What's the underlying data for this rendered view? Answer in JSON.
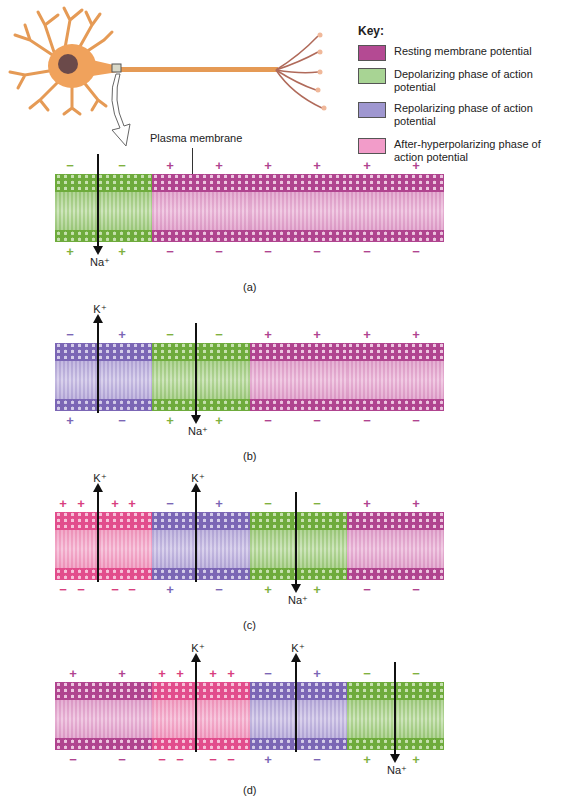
{
  "colors": {
    "resting": {
      "head": "#b0448f",
      "tail": "#ecc4df",
      "mid": "#f8e4f1",
      "charge": "#b0448f"
    },
    "depolarizing": {
      "head": "#6eab3c",
      "tail": "#c5e0ae",
      "mid": "#e6f2dc",
      "charge": "#7fb13f"
    },
    "repolarizing": {
      "head": "#7b66b5",
      "tail": "#d3cbe8",
      "mid": "#ece8f6",
      "charge": "#7b66b5"
    },
    "after_hyperpolarizing": {
      "head": "#e24d8c",
      "tail": "#f6c0d8",
      "mid": "#fbe2ee",
      "charge": "#d8407e"
    }
  },
  "key": {
    "title": "Key:",
    "items": [
      {
        "label": "Resting membrane potential",
        "color": "#b44a93"
      },
      {
        "label": "Depolarizing phase of action potential",
        "color": "#a8d494"
      },
      {
        "label": "Repolarizing phase of action potential",
        "color": "#9f97d0"
      },
      {
        "label": "After-hyperpolarizing phase of action potential",
        "color": "#f29cc9"
      }
    ]
  },
  "neuron": {
    "body_color": "#f0a25c",
    "nucleus_color": "#6b4a4a"
  },
  "callout": {
    "plasma_membrane": "Plasma membrane"
  },
  "ions": {
    "na": "Na⁺",
    "k": "K⁺"
  },
  "panels": [
    {
      "label": "(a)",
      "segments": [
        "depolarizing",
        "resting",
        "resting",
        "resting"
      ],
      "top_charges": [
        "−",
        "−",
        "+",
        "+",
        "+",
        "+",
        "+",
        "+"
      ],
      "bottom_charges": [
        "+",
        "+",
        "−",
        "−",
        "−",
        "−",
        "−",
        "−"
      ]
    },
    {
      "label": "(b)",
      "segments": [
        "repolarizing",
        "depolarizing",
        "resting",
        "resting"
      ],
      "top_charges": [
        "−",
        "+",
        "−",
        "−",
        "+",
        "+",
        "+",
        "+"
      ],
      "bottom_charges": [
        "+",
        "−",
        "+",
        "+",
        "−",
        "−",
        "−",
        "−"
      ]
    },
    {
      "label": "(c)",
      "segments": [
        "after_hyperpolarizing",
        "repolarizing",
        "depolarizing",
        "resting"
      ],
      "top_charges": [
        "+",
        "+",
        "+",
        "+",
        "−",
        "+",
        "−",
        "−",
        "+",
        "+"
      ],
      "bottom_charges": [
        "−",
        "−",
        "−",
        "−",
        "+",
        "−",
        "+",
        "+",
        "−",
        "−"
      ]
    },
    {
      "label": "(d)",
      "segments": [
        "resting",
        "after_hyperpolarizing",
        "repolarizing",
        "depolarizing"
      ],
      "top_charges": [
        "+",
        "+",
        "+",
        "+",
        "+",
        "+",
        "−",
        "+",
        "−",
        "−"
      ],
      "bottom_charges": [
        "−",
        "−",
        "−",
        "−",
        "−",
        "−",
        "+",
        "−",
        "+",
        "+"
      ]
    }
  ]
}
